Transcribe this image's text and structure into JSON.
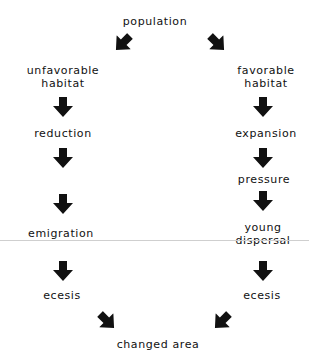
{
  "diagram": {
    "top": {
      "label": "population"
    },
    "left_branch": {
      "start": {
        "line1": "unfavorable",
        "line2": "habitat"
      },
      "steps": [
        "reduction",
        "emigration",
        "ecesis"
      ]
    },
    "right_branch": {
      "start": {
        "line1": "favorable",
        "line2": "habitat"
      },
      "steps": [
        "expansion",
        "pressure",
        "ecesis"
      ],
      "dispersal": {
        "line1": "young",
        "line2": "dispersal"
      }
    },
    "bottom": {
      "label": "changed area"
    },
    "colors": {
      "arrow": "#111111",
      "text": "#111111",
      "rule": "#cfcfcf",
      "background": "#ffffff"
    }
  }
}
